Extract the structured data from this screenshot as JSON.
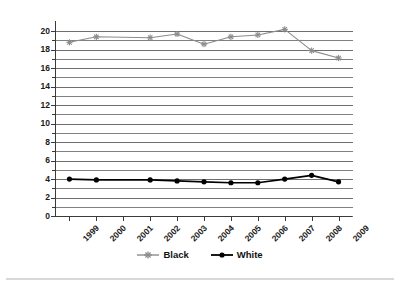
{
  "chart_data": {
    "type": "line",
    "title": "",
    "xlabel": "",
    "ylabel": "Rate per 100,000",
    "categories": [
      "1999",
      "2000",
      "2001",
      "2002",
      "2003",
      "2004",
      "2005",
      "2006",
      "2007",
      "2008",
      "2009"
    ],
    "ylim": [
      0,
      21
    ],
    "ytick_step": 2,
    "gridline_step": 1,
    "grid": true,
    "legend_position": "bottom-center",
    "series": [
      {
        "name": "Black",
        "color": "#8c8c8c",
        "marker": "star",
        "values": [
          18.8,
          19.4,
          null,
          19.3,
          19.7,
          18.6,
          19.4,
          19.6,
          20.2,
          17.9,
          17.1
        ]
      },
      {
        "name": "White",
        "color": "#000000",
        "marker": "circle",
        "values": [
          4.0,
          3.9,
          null,
          3.9,
          3.8,
          3.7,
          3.6,
          3.6,
          4.0,
          4.4,
          3.7
        ]
      }
    ],
    "ytick_labels": [
      "0",
      "2",
      "4",
      "6",
      "8",
      "10",
      "12",
      "14",
      "16",
      "18",
      "20"
    ],
    "ytick_values": [
      0,
      2,
      4,
      6,
      8,
      10,
      12,
      14,
      16,
      18,
      20
    ]
  },
  "axis": {
    "y_title": "Rate per 100,000"
  },
  "legend": {
    "items": [
      {
        "label": "Black"
      },
      {
        "label": "White"
      }
    ]
  },
  "colors": {
    "black_series": "#8c8c8c",
    "white_series": "#000000",
    "gridline": "#808080",
    "axis": "#3a3a3a",
    "background": "#ffffff",
    "footer_rule": "#d8d8d8"
  }
}
